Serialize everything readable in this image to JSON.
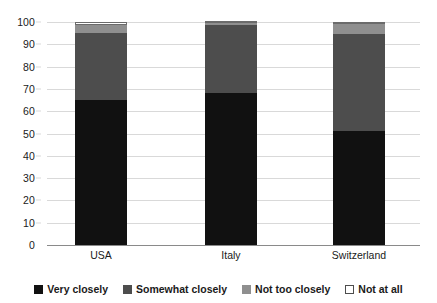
{
  "chart_data": {
    "type": "bar",
    "subtype": "stacked-bar-100",
    "title": "",
    "subtitle": "",
    "xlabel": "",
    "ylabel": "",
    "categories": [
      "USA",
      "Italy",
      "Switzerland"
    ],
    "series": [
      {
        "name": "Very closely",
        "color": "#111111",
        "values": [
          65,
          68,
          51
        ]
      },
      {
        "name": "Somewhat closely",
        "color": "#4d4d4d",
        "values": [
          30,
          30.5,
          43.5
        ]
      },
      {
        "name": "Not too closely",
        "color": "#8f8f8f",
        "values": [
          3.5,
          1,
          4.5
        ]
      },
      {
        "name": "Not at all",
        "color": "#ffffff",
        "values": [
          1.5,
          0.5,
          1
        ]
      }
    ],
    "ylim": [
      0,
      100
    ],
    "ytick_values": [
      0,
      10,
      20,
      30,
      40,
      50,
      60,
      70,
      80,
      90,
      100
    ],
    "ytick_labels": [
      "0",
      "10",
      "20",
      "30",
      "40",
      "50",
      "60",
      "70",
      "80",
      "90",
      "100"
    ],
    "grid": true,
    "grid_axis": "y",
    "legend_position": "bottom",
    "legend_entries": [
      "Very closely",
      "Somewhat closely",
      "Not too closely",
      "Not at all"
    ]
  },
  "axis": {
    "y_labels": [
      "100",
      "90",
      "80",
      "70",
      "60",
      "50",
      "40",
      "30",
      "20",
      "10",
      "0"
    ],
    "x_labels": [
      "USA",
      "Italy",
      "Switzerland"
    ]
  },
  "legend": {
    "items": [
      {
        "label": "Very closely",
        "swatch": "legend-swatch-black"
      },
      {
        "label": "Somewhat closely",
        "swatch": "legend-swatch-dark-gray"
      },
      {
        "label": "Not too closely",
        "swatch": "legend-swatch-light-gray"
      },
      {
        "label": "Not at all",
        "swatch": "legend-swatch-white"
      }
    ]
  }
}
